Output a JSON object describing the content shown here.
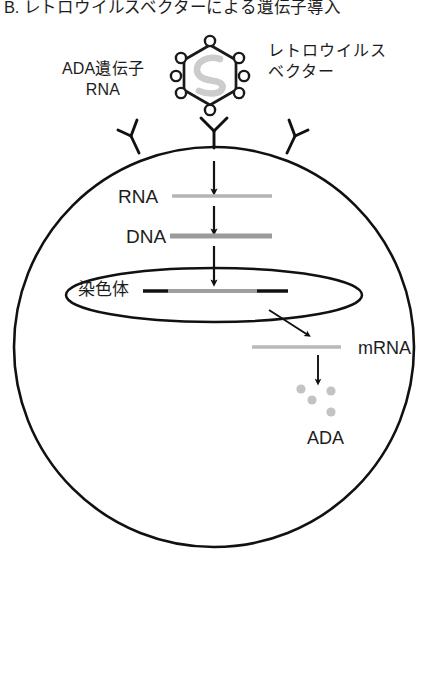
{
  "figure": {
    "title": "B. レトロウイルスベクターによる遺伝子導入",
    "panel_letter": "B."
  },
  "labels": {
    "ada_gene_rna_line1": "ADA遺伝子",
    "ada_gene_rna_line2": "RNA",
    "retrovirus_vector_line1": "レトロウイルス",
    "retrovirus_vector_line2": "ベクター",
    "rna": "RNA",
    "dna": "DNA",
    "chromosome": "染色体",
    "mrna": "mRNA",
    "ada": "ADA"
  },
  "virus": {
    "capsid_shape": "hexagon",
    "spike_count": 8,
    "rna_glyph": "S",
    "outline_color": "#1a1a1a",
    "rna_color": "#c9c9c9"
  },
  "cell": {
    "membrane_color": "#111111",
    "receptor_count": 3,
    "nucleus_shape": "ellipse"
  },
  "nucleic_acids": {
    "rna_strand_color": "#b4b4b4",
    "dna_strand_color": "#9a9a9a",
    "mrna_strand_color": "#b9b9b9",
    "chromosome_line_color": "#111111",
    "chromosome_insert_color": "#9e9e9e"
  },
  "protein": {
    "name": "ADA",
    "dot_count": 4,
    "dot_color": "#c3c3c3"
  },
  "arrows": {
    "count": 5,
    "color": "#111111",
    "sequence": [
      "virus-entry-to-rna",
      "rna-to-dna",
      "dna-to-chromosome",
      "chromosome-to-mrna",
      "mrna-to-ada"
    ]
  }
}
